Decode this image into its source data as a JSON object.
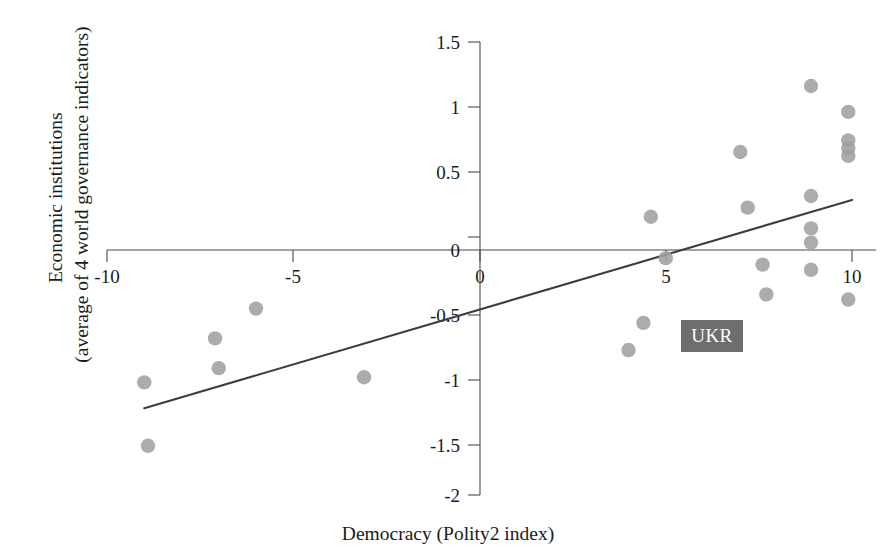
{
  "figure": {
    "background_color": "#ffffff",
    "point_color": "#a0a0a0",
    "line_color": "#3c3c48",
    "axis_color": "#4a4a4a",
    "annotation_bg_color": "#6e6e6e",
    "annotation_text_color": "#ffffff"
  },
  "labels": {
    "ylabel_line1": "Economic institutions",
    "ylabel_line2": "(average of 4 world governance indicators)",
    "xlabel": "Democracy (Polity2 index)",
    "annotation": "UKR"
  },
  "chart_data": {
    "type": "scatter",
    "title": "",
    "xlabel": "Democracy (Polity2 index)",
    "ylabel": "Economic institutions (average of 4 world governance indicators)",
    "xlim": [
      -10,
      10
    ],
    "ylim": [
      -2,
      1.5
    ],
    "xticks": [
      -10,
      -5,
      0,
      5,
      10
    ],
    "xtick_labels": [
      "-10",
      "-5",
      "0",
      "5",
      "10"
    ],
    "yticks": [
      -2,
      -1.5,
      -1,
      -0.5,
      0,
      0.5,
      1,
      1.5
    ],
    "ytick_labels": [
      "-2",
      "-1.5",
      "-1",
      "-0.5",
      "0",
      "0.5",
      "1",
      "1.5"
    ],
    "grid": false,
    "legend": null,
    "points": [
      {
        "x": -9.0,
        "y": -1.13
      },
      {
        "x": -8.9,
        "y": -1.62
      },
      {
        "x": -7.1,
        "y": -0.79
      },
      {
        "x": -7.0,
        "y": -1.02
      },
      {
        "x": -6.0,
        "y": -0.56
      },
      {
        "x": -3.1,
        "y": -1.09
      },
      {
        "x": 4.0,
        "y": -0.88
      },
      {
        "x": 4.4,
        "y": -0.67
      },
      {
        "x": 4.6,
        "y": 0.15
      },
      {
        "x": 5.0,
        "y": -0.17
      },
      {
        "x": 7.0,
        "y": 0.65
      },
      {
        "x": 7.2,
        "y": 0.22
      },
      {
        "x": 7.6,
        "y": -0.22
      },
      {
        "x": 7.7,
        "y": -0.45
      },
      {
        "x": 8.9,
        "y": 1.16
      },
      {
        "x": 8.9,
        "y": 0.31
      },
      {
        "x": 8.9,
        "y": 0.06
      },
      {
        "x": 8.9,
        "y": -0.05
      },
      {
        "x": 8.9,
        "y": -0.26
      },
      {
        "x": 9.9,
        "y": 0.96
      },
      {
        "x": 9.9,
        "y": 0.74
      },
      {
        "x": 9.9,
        "y": 0.68
      },
      {
        "x": 9.9,
        "y": 0.62
      },
      {
        "x": 9.9,
        "y": -0.49
      }
    ],
    "trend_line": {
      "x_start": -9.0,
      "y_start": -1.33,
      "x_end": 10.0,
      "y_end": 0.28,
      "slope": 0.0847,
      "intercept": -0.567
    },
    "annotations": [
      {
        "label": "UKR",
        "x": 6.3,
        "y": -0.77
      }
    ]
  }
}
